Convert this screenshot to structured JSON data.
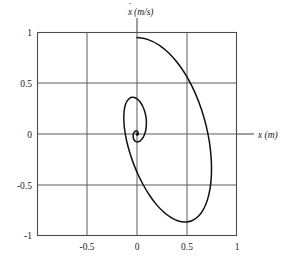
{
  "figure": {
    "axis_labels": {
      "y": "ẋ (m/s)",
      "y_symbol": "x",
      "y_units": "(m/s)",
      "x": "x (m)",
      "x_symbol": "x",
      "x_units": "(m)"
    },
    "colors": {
      "background": "#ffffff",
      "frame": "#4d4d4d",
      "gridline": "#5a5a5a",
      "curve": "#111111",
      "text": "#1a1a1a"
    }
  },
  "chart_data": {
    "type": "line",
    "title": "",
    "subtitle": "",
    "xlabel": "x (m)",
    "ylabel": "ẋ (m/s)",
    "xlim": [
      -1,
      1
    ],
    "ylim": [
      -1,
      1
    ],
    "grid": true,
    "legend": false,
    "legend_position": "none",
    "x_ticks": [
      -1,
      -0.5,
      0,
      0.5,
      1
    ],
    "x_tick_labels": [
      "",
      "-0.5",
      "0",
      "0.5",
      "1"
    ],
    "y_ticks": [
      -1,
      -0.5,
      0,
      0.5,
      1
    ],
    "y_tick_labels": [
      "-1",
      "-0.5",
      "0",
      "0.5",
      "1"
    ],
    "series": [
      {
        "name": "phase trajectory",
        "start_point": [
          0,
          0.95
        ],
        "end_point": [
          0,
          0
        ],
        "extrema": {
          "max_x": 0.78,
          "min_x": -0.4,
          "max_y": 0.95,
          "min_y": -0.57
        },
        "points": [
          [
            0.0,
            0.95
          ],
          [
            0.112,
            0.93
          ],
          [
            0.222,
            0.876
          ],
          [
            0.327,
            0.791
          ],
          [
            0.424,
            0.68
          ],
          [
            0.511,
            0.548
          ],
          [
            0.586,
            0.4
          ],
          [
            0.648,
            0.241
          ],
          [
            0.696,
            0.077
          ],
          [
            0.729,
            -0.088
          ],
          [
            0.746,
            -0.248
          ],
          [
            0.748,
            -0.398
          ],
          [
            0.735,
            -0.533
          ],
          [
            0.708,
            -0.649
          ],
          [
            0.668,
            -0.742
          ],
          [
            0.617,
            -0.81
          ],
          [
            0.556,
            -0.852
          ],
          [
            0.488,
            -0.867
          ],
          [
            0.415,
            -0.857
          ],
          [
            0.34,
            -0.822
          ],
          [
            0.265,
            -0.766
          ],
          [
            0.192,
            -0.691
          ],
          [
            0.124,
            -0.601
          ],
          [
            0.062,
            -0.5
          ],
          [
            0.007,
            -0.392
          ],
          [
            -0.039,
            -0.282
          ],
          [
            -0.076,
            -0.173
          ],
          [
            -0.104,
            -0.069
          ],
          [
            -0.122,
            0.027
          ],
          [
            -0.131,
            0.113
          ],
          [
            -0.132,
            0.188
          ],
          [
            -0.126,
            0.249
          ],
          [
            -0.113,
            0.297
          ],
          [
            -0.095,
            0.331
          ],
          [
            -0.074,
            0.352
          ],
          [
            -0.051,
            0.361
          ],
          [
            -0.027,
            0.359
          ],
          [
            -0.003,
            0.348
          ],
          [
            0.019,
            0.329
          ],
          [
            0.04,
            0.303
          ],
          [
            0.057,
            0.273
          ],
          [
            0.072,
            0.24
          ],
          [
            0.082,
            0.205
          ],
          [
            0.09,
            0.169
          ],
          [
            0.094,
            0.133
          ],
          [
            0.094,
            0.098
          ],
          [
            0.092,
            0.065
          ],
          [
            0.087,
            0.034
          ],
          [
            0.079,
            0.007
          ],
          [
            0.07,
            -0.017
          ],
          [
            0.059,
            -0.037
          ],
          [
            0.047,
            -0.053
          ],
          [
            0.035,
            -0.065
          ],
          [
            0.023,
            -0.073
          ],
          [
            0.011,
            -0.077
          ],
          [
            0.0,
            -0.078
          ],
          [
            -0.01,
            -0.075
          ],
          [
            -0.019,
            -0.07
          ],
          [
            -0.026,
            -0.062
          ],
          [
            -0.032,
            -0.053
          ],
          [
            -0.036,
            -0.042
          ],
          [
            -0.038,
            -0.031
          ],
          [
            -0.039,
            -0.02
          ],
          [
            -0.038,
            -0.009
          ],
          [
            -0.036,
            0.001
          ],
          [
            -0.032,
            0.01
          ],
          [
            -0.028,
            0.017
          ],
          [
            -0.023,
            0.023
          ],
          [
            -0.018,
            0.027
          ],
          [
            -0.013,
            0.029
          ],
          [
            -0.008,
            0.03
          ],
          [
            -0.003,
            0.029
          ],
          [
            0.001,
            0.027
          ],
          [
            0.005,
            0.024
          ],
          [
            0.008,
            0.02
          ],
          [
            0.01,
            0.015
          ],
          [
            0.012,
            0.011
          ],
          [
            0.013,
            0.006
          ],
          [
            0.013,
            0.002
          ],
          [
            0.012,
            -0.002
          ],
          [
            0.011,
            -0.005
          ],
          [
            0.009,
            -0.008
          ],
          [
            0.007,
            -0.01
          ],
          [
            0.005,
            -0.011
          ],
          [
            0.003,
            -0.011
          ],
          [
            0.001,
            -0.011
          ],
          [
            -0.001,
            -0.01
          ],
          [
            -0.003,
            -0.008
          ],
          [
            -0.004,
            -0.006
          ],
          [
            -0.005,
            -0.004
          ],
          [
            -0.005,
            -0.002
          ],
          [
            -0.005,
            0.0
          ],
          [
            -0.004,
            0.002
          ],
          [
            -0.003,
            0.003
          ],
          [
            -0.002,
            0.004
          ],
          [
            -0.001,
            0.004
          ],
          [
            0.0,
            0.004
          ],
          [
            0.001,
            0.003
          ],
          [
            0.002,
            0.002
          ],
          [
            0.002,
            0.001
          ],
          [
            0.002,
            0.0
          ],
          [
            0.001,
            -0.001
          ],
          [
            0.001,
            -0.001
          ],
          [
            0.0,
            -0.001
          ],
          [
            0.0,
            0.0
          ]
        ]
      }
    ]
  }
}
